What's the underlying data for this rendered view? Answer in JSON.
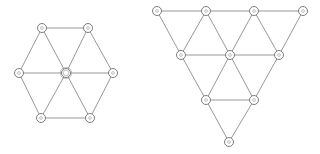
{
  "diagram": {
    "background": "#ffffff",
    "edge_color": "#8c8c8c",
    "node_color": "#6e6e6e",
    "node_radius": 4.5,
    "graphs": [
      {
        "name": "hexagon-wheel-graph",
        "nodes": [
          {
            "id": "h0",
            "x": 66,
            "y": 73,
            "hub": true
          },
          {
            "id": "h1",
            "x": 42,
            "y": 28
          },
          {
            "id": "h2",
            "x": 88,
            "y": 28
          },
          {
            "id": "h3",
            "x": 113,
            "y": 73
          },
          {
            "id": "h4",
            "x": 90,
            "y": 118
          },
          {
            "id": "h5",
            "x": 41,
            "y": 118
          },
          {
            "id": "h6",
            "x": 19,
            "y": 73
          }
        ],
        "edges": [
          [
            "h1",
            "h2"
          ],
          [
            "h2",
            "h3"
          ],
          [
            "h3",
            "h4"
          ],
          [
            "h4",
            "h5"
          ],
          [
            "h5",
            "h6"
          ],
          [
            "h6",
            "h1"
          ],
          [
            "h0",
            "h1"
          ],
          [
            "h0",
            "h2"
          ],
          [
            "h0",
            "h3"
          ],
          [
            "h0",
            "h4"
          ],
          [
            "h0",
            "h5"
          ],
          [
            "h0",
            "h6"
          ]
        ]
      },
      {
        "name": "inverted-triangular-grid-graph",
        "nodes": [
          {
            "id": "t0",
            "x": 157,
            "y": 11
          },
          {
            "id": "t1",
            "x": 206,
            "y": 11
          },
          {
            "id": "t2",
            "x": 254,
            "y": 11
          },
          {
            "id": "t3",
            "x": 303,
            "y": 11
          },
          {
            "id": "t4",
            "x": 181,
            "y": 55
          },
          {
            "id": "t5",
            "x": 230,
            "y": 55
          },
          {
            "id": "t6",
            "x": 279,
            "y": 55
          },
          {
            "id": "t7",
            "x": 206,
            "y": 100
          },
          {
            "id": "t8",
            "x": 254,
            "y": 100
          },
          {
            "id": "t9",
            "x": 229,
            "y": 142
          }
        ],
        "edges": [
          [
            "t0",
            "t1"
          ],
          [
            "t1",
            "t2"
          ],
          [
            "t2",
            "t3"
          ],
          [
            "t4",
            "t5"
          ],
          [
            "t5",
            "t6"
          ],
          [
            "t7",
            "t8"
          ],
          [
            "t0",
            "t4"
          ],
          [
            "t1",
            "t4"
          ],
          [
            "t1",
            "t5"
          ],
          [
            "t2",
            "t5"
          ],
          [
            "t2",
            "t6"
          ],
          [
            "t3",
            "t6"
          ],
          [
            "t4",
            "t7"
          ],
          [
            "t5",
            "t7"
          ],
          [
            "t5",
            "t8"
          ],
          [
            "t6",
            "t8"
          ],
          [
            "t7",
            "t9"
          ],
          [
            "t8",
            "t9"
          ]
        ]
      }
    ]
  }
}
